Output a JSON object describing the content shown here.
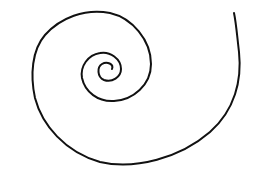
{
  "figure": {
    "stroke_color": "#111111",
    "background_color": "#ffffff",
    "stroke_width": 2
  }
}
